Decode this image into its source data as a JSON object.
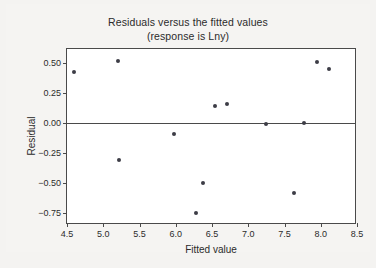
{
  "chart_data": {
    "type": "scatter",
    "title": "Residuals versus the fitted values",
    "subtitle": "(response is Lny)",
    "xlabel": "Fitted value",
    "ylabel": "Residual",
    "xlim": [
      4.5,
      8.5
    ],
    "ylim": [
      -0.85,
      0.62
    ],
    "xticks": [
      "4.5",
      "5.0",
      "5.5",
      "6.0",
      "6.5",
      "7.0",
      "7.5",
      "8.0",
      "8.5"
    ],
    "xtick_values": [
      4.5,
      5.0,
      5.5,
      6.0,
      6.5,
      7.0,
      7.5,
      8.0,
      8.5
    ],
    "yticks": [
      "0.50",
      "0.25",
      "0.00",
      "−0.25",
      "−0.50",
      "−0.75"
    ],
    "ytick_values": [
      0.5,
      0.25,
      0.0,
      -0.25,
      -0.5,
      -0.75
    ],
    "grid": false,
    "legend": null,
    "reference_line": {
      "orientation": "horizontal",
      "y": 0.0
    },
    "marker_color": "#3d3d46",
    "axis_color": "#4a4a4a",
    "background_color": "#f4f3f1",
    "plot_background_color": "#ffffff",
    "x": [
      4.6,
      5.21,
      5.22,
      5.97,
      6.28,
      6.38,
      6.54,
      6.7,
      7.25,
      7.63,
      7.77,
      7.95,
      8.11
    ],
    "y": [
      0.43,
      0.52,
      -0.31,
      -0.09,
      -0.75,
      -0.5,
      0.14,
      0.16,
      -0.01,
      -0.58,
      0.0,
      0.51,
      0.45
    ],
    "points": [
      {
        "x": 4.6,
        "y": 0.43
      },
      {
        "x": 5.21,
        "y": 0.52
      },
      {
        "x": 5.22,
        "y": -0.31
      },
      {
        "x": 5.97,
        "y": -0.09
      },
      {
        "x": 6.28,
        "y": -0.75
      },
      {
        "x": 6.38,
        "y": -0.5
      },
      {
        "x": 6.54,
        "y": 0.14
      },
      {
        "x": 6.7,
        "y": 0.16
      },
      {
        "x": 7.25,
        "y": -0.01
      },
      {
        "x": 7.63,
        "y": -0.58
      },
      {
        "x": 7.77,
        "y": 0.0
      },
      {
        "x": 7.95,
        "y": 0.51
      },
      {
        "x": 8.11,
        "y": 0.45
      }
    ]
  }
}
